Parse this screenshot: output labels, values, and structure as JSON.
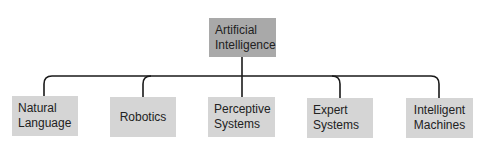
{
  "diagram": {
    "type": "hierarchy",
    "root": {
      "label": "Artificial\nIntelligence",
      "fill": "#a9a9a9"
    },
    "children": [
      {
        "label": "Natural\nLanguage",
        "fill": "#d5d5d5"
      },
      {
        "label": "Robotics",
        "fill": "#d5d5d5"
      },
      {
        "label": "Perceptive\nSystems",
        "fill": "#d5d5d5"
      },
      {
        "label": "Expert\nSystems",
        "fill": "#d5d5d5"
      },
      {
        "label": "Intelligent\nMachines",
        "fill": "#d5d5d5"
      }
    ],
    "connector_color": "#1a1a1a"
  }
}
